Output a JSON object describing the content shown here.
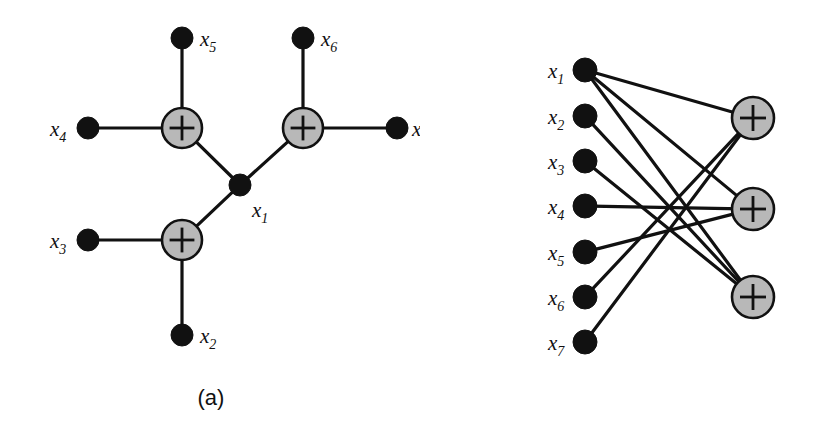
{
  "figure": {
    "background_color": "#ffffff",
    "edge_color": "#111111",
    "variable_node_color": "#111111",
    "factor_node_fill": "#b8b8b8",
    "factor_node_stroke": "#111111",
    "factor_symbol": "+"
  },
  "panels": [
    {
      "id": "a",
      "caption": "(a)",
      "type": "tree-factor-graph",
      "variables": [
        {
          "name": "x1",
          "label": "x",
          "sub": "1",
          "x": 240,
          "y": 185,
          "r": 11,
          "label_x": 252,
          "label_y": 217
        },
        {
          "name": "x2",
          "label": "x",
          "sub": "2",
          "x": 182,
          "y": 335,
          "r": 11,
          "label_x": 200,
          "label_y": 343
        },
        {
          "name": "x3",
          "label": "x",
          "sub": "3",
          "x": 88,
          "y": 240,
          "r": 11,
          "label_x": 50,
          "label_y": 248
        },
        {
          "name": "x4",
          "label": "x",
          "sub": "4",
          "x": 88,
          "y": 128,
          "r": 11,
          "label_x": 50,
          "label_y": 136
        },
        {
          "name": "x5",
          "label": "x",
          "sub": "5",
          "x": 182,
          "y": 38,
          "r": 11,
          "label_x": 200,
          "label_y": 46
        },
        {
          "name": "x6",
          "label": "x",
          "sub": "6",
          "x": 303,
          "y": 38,
          "r": 11,
          "label_x": 321,
          "label_y": 46
        },
        {
          "name": "x7",
          "label": "x",
          "sub": "7",
          "x": 397,
          "y": 128,
          "r": 11,
          "label_x": 412,
          "label_y": 136
        }
      ],
      "factors": [
        {
          "name": "factor-left-top",
          "x": 182,
          "y": 128,
          "r": 20
        },
        {
          "name": "factor-right-top",
          "x": 303,
          "y": 128,
          "r": 20
        },
        {
          "name": "factor-bottom",
          "x": 182,
          "y": 240,
          "r": 20
        }
      ],
      "edges": [
        {
          "from": "x5",
          "to": "factor-left-top"
        },
        {
          "from": "x4",
          "to": "factor-left-top"
        },
        {
          "from": "factor-left-top",
          "to": "x1"
        },
        {
          "from": "x6",
          "to": "factor-right-top"
        },
        {
          "from": "x7",
          "to": "factor-right-top"
        },
        {
          "from": "factor-right-top",
          "to": "x1"
        },
        {
          "from": "x3",
          "to": "factor-bottom"
        },
        {
          "from": "x2",
          "to": "factor-bottom"
        },
        {
          "from": "factor-bottom",
          "to": "x1"
        }
      ]
    },
    {
      "id": "b",
      "caption": "(b)",
      "type": "bipartite-tanner-graph",
      "variables": [
        {
          "name": "x1",
          "label": "x",
          "sub": "1",
          "x": 165,
          "y": 70,
          "r": 12,
          "label_x": 128,
          "label_y": 78
        },
        {
          "name": "x2",
          "label": "x",
          "sub": "2",
          "x": 165,
          "y": 116,
          "r": 12,
          "label_x": 128,
          "label_y": 124
        },
        {
          "name": "x3",
          "label": "x",
          "sub": "3",
          "x": 165,
          "y": 161,
          "r": 12,
          "label_x": 128,
          "label_y": 169
        },
        {
          "name": "x4",
          "label": "x",
          "sub": "4",
          "x": 165,
          "y": 206,
          "r": 12,
          "label_x": 128,
          "label_y": 214
        },
        {
          "name": "x5",
          "label": "x",
          "sub": "5",
          "x": 165,
          "y": 252,
          "r": 12,
          "label_x": 128,
          "label_y": 260
        },
        {
          "name": "x6",
          "label": "x",
          "sub": "6",
          "x": 165,
          "y": 297,
          "r": 12,
          "label_x": 128,
          "label_y": 305
        },
        {
          "name": "x7",
          "label": "x",
          "sub": "7",
          "x": 165,
          "y": 342,
          "r": 12,
          "label_x": 128,
          "label_y": 350
        }
      ],
      "factors": [
        {
          "name": "check-1",
          "x": 333,
          "y": 118,
          "r": 21
        },
        {
          "name": "check-2",
          "x": 333,
          "y": 209,
          "r": 21
        },
        {
          "name": "check-3",
          "x": 333,
          "y": 297,
          "r": 21
        }
      ],
      "edges": [
        {
          "from": "x1",
          "to": "check-1"
        },
        {
          "from": "x1",
          "to": "check-2"
        },
        {
          "from": "x1",
          "to": "check-3"
        },
        {
          "from": "x2",
          "to": "check-3"
        },
        {
          "from": "x3",
          "to": "check-3"
        },
        {
          "from": "x4",
          "to": "check-2"
        },
        {
          "from": "x5",
          "to": "check-2"
        },
        {
          "from": "x6",
          "to": "check-1"
        },
        {
          "from": "x7",
          "to": "check-1"
        }
      ]
    }
  ]
}
